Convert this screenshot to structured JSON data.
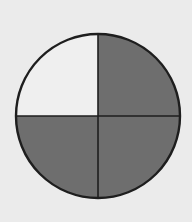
{
  "diagram": {
    "type": "fraction-circle",
    "fraction": "3/4",
    "total_parts": 4,
    "shaded_parts": 3,
    "quadrants": [
      {
        "position": "top-left",
        "shaded": false
      },
      {
        "position": "top-right",
        "shaded": true
      },
      {
        "position": "bottom-left",
        "shaded": true
      },
      {
        "position": "bottom-right",
        "shaded": true
      }
    ],
    "colors": {
      "background": "#ebebeb",
      "shaded": "#6e6e6e",
      "unshaded": "#efefef",
      "outline": "#1e1e1e"
    },
    "geometry": {
      "cx": 98,
      "cy": 116,
      "r": 82
    }
  }
}
